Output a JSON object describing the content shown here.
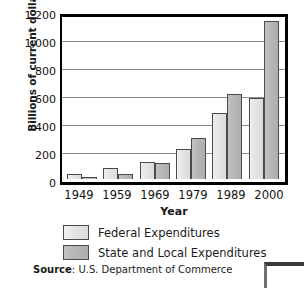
{
  "chart_data": {
    "type": "bar",
    "title": "",
    "xlabel": "Year",
    "ylabel": "Billions of current dollars",
    "categories": [
      "1949",
      "1959",
      "1969",
      "1979",
      "1989",
      "2000"
    ],
    "series": [
      {
        "name": "Federal Expenditures",
        "color": "#e3e3e3",
        "values": [
          38,
          78,
          125,
          215,
          480,
          588
        ]
      },
      {
        "name": "State and Local Expenditures",
        "color": "#b6b6b6",
        "values": [
          18,
          33,
          115,
          295,
          620,
          1150
        ]
      }
    ],
    "ylim": [
      0,
      1200
    ],
    "yticks": [
      "0",
      "200",
      "400",
      "600",
      "800",
      "1,000",
      "1,200"
    ],
    "ytick_values": [
      0,
      200,
      400,
      600,
      800,
      1000,
      1200
    ],
    "grid": true,
    "legend_position": "below"
  },
  "legend": {
    "items": [
      {
        "label": "Federal Expenditures"
      },
      {
        "label": "State and Local Expenditures"
      }
    ]
  },
  "source": {
    "prefix": "Source",
    "separator": ": ",
    "text": "U.S. Department of Commerce"
  }
}
